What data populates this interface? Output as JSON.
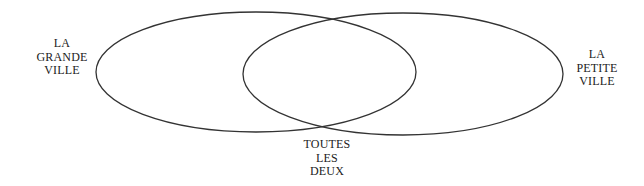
{
  "diagram": {
    "type": "venn",
    "stroke_color": "#333333",
    "background": "#ffffff",
    "sets": [
      {
        "id": "left",
        "lines": [
          "LA",
          "GRANDE",
          "VILLE"
        ],
        "ellipse": {
          "cx": 256,
          "cy": 72,
          "rx": 160,
          "ry": 60
        }
      },
      {
        "id": "right",
        "lines": [
          "LA",
          "PETITE",
          "VILLE"
        ],
        "ellipse": {
          "cx": 403,
          "cy": 74,
          "rx": 160,
          "ry": 61
        }
      }
    ],
    "intersection": {
      "lines": [
        "TOUTES",
        "LES",
        "DEUX"
      ]
    }
  }
}
